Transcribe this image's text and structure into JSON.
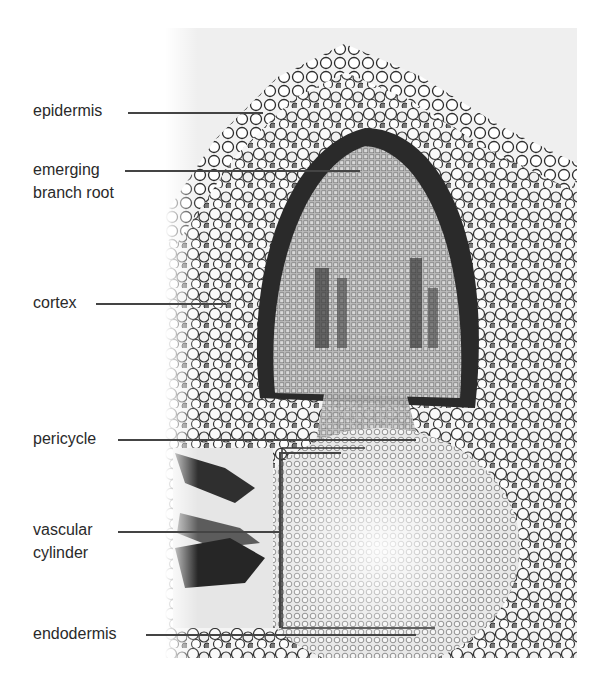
{
  "figure": {
    "labels": [
      {
        "id": "epidermis",
        "text": "epidermis"
      },
      {
        "id": "emerging-branch-root",
        "line1": "emerging",
        "line2": "branch root"
      },
      {
        "id": "cortex",
        "text": "cortex"
      },
      {
        "id": "pericycle",
        "text": "pericycle"
      },
      {
        "id": "vascular-cylinder",
        "line1": "vascular",
        "line2": "cylinder"
      },
      {
        "id": "endodermis",
        "text": "endodermis"
      }
    ],
    "colors": {
      "background": "#ffffff",
      "label_text": "#2a2a2a",
      "leader_line": "#444444"
    }
  }
}
